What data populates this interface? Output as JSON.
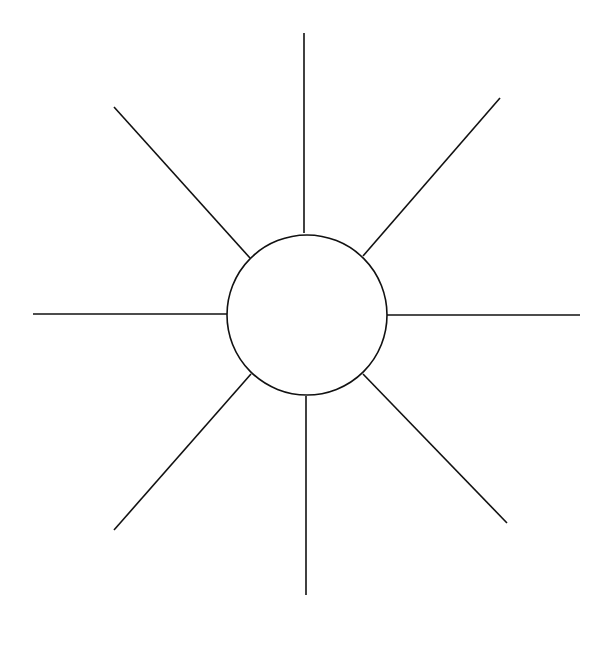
{
  "diagram": {
    "type": "radial-starburst",
    "background": "#ffffff",
    "stroke_color": "#111111",
    "stroke_width": 1.6,
    "hub": {
      "cx": 307,
      "cy": 315,
      "r": 80,
      "fill": "#ffffff",
      "label": ""
    },
    "rays": [
      {
        "direction": "north",
        "x1": 304,
        "y1": 233,
        "x2": 304,
        "y2": 33,
        "label": ""
      },
      {
        "direction": "north-east",
        "x1": 363,
        "y1": 256,
        "x2": 500,
        "y2": 98,
        "label": ""
      },
      {
        "direction": "east",
        "x1": 387,
        "y1": 315,
        "x2": 580,
        "y2": 315,
        "label": ""
      },
      {
        "direction": "south-east",
        "x1": 363,
        "y1": 374,
        "x2": 507,
        "y2": 523,
        "label": ""
      },
      {
        "direction": "south",
        "x1": 306,
        "y1": 396,
        "x2": 306,
        "y2": 595,
        "label": ""
      },
      {
        "direction": "south-west",
        "x1": 251,
        "y1": 374,
        "x2": 114,
        "y2": 530,
        "label": ""
      },
      {
        "direction": "west",
        "x1": 228,
        "y1": 314,
        "x2": 33,
        "y2": 314,
        "label": ""
      },
      {
        "direction": "north-west",
        "x1": 250,
        "y1": 258,
        "x2": 114,
        "y2": 107,
        "label": ""
      }
    ]
  }
}
